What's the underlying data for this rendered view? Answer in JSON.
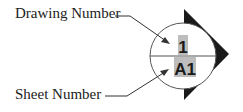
{
  "labels": {
    "drawing_number": "Drawing Number",
    "sheet_number": "Sheet Number"
  },
  "symbol": {
    "drawing_value": "1",
    "sheet_value": "A1",
    "highlight_color": "#bdbdbd",
    "arrow_color": "#1a1a1a"
  }
}
